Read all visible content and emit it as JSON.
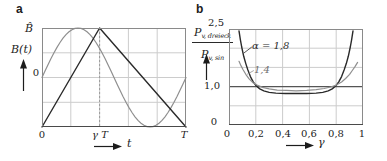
{
  "figure_colors": {
    "grid": "#cccccc",
    "border": "#8a8a8a",
    "axis": "#4a4a4a",
    "dashed": "#9a9a9a",
    "unity_line": "#555555",
    "dark_curve": "#2a2a2a",
    "light_curve": "#8f8f8f"
  },
  "chart_data": [
    {
      "type": "line",
      "panel_letter": "a",
      "xlabel": "t",
      "ylabel": "B(t)",
      "xlim": [
        0,
        1
      ],
      "ylim": [
        -1,
        1
      ],
      "x_ticks": [
        {
          "pos": 0,
          "label": "0"
        },
        {
          "pos": 0.4,
          "label": "γ T"
        },
        {
          "pos": 1,
          "label": "T"
        }
      ],
      "y_labels": {
        "peak": "B̂",
        "axis": "B(t)",
        "zero": "0"
      },
      "x_axis_symbol": "t",
      "grid": {
        "x": [
          0.2,
          0.4,
          0.6,
          0.8
        ],
        "y": [
          -0.5,
          0,
          0.5
        ]
      },
      "dashed_vline": 0.4,
      "gamma": 0.4,
      "series": [
        {
          "name": "sinusoidal-flux",
          "color": "#8f8f8f",
          "width": 1.2,
          "points": [
            [
              0,
              0
            ],
            [
              0.0208,
              0.131
            ],
            [
              0.0417,
              0.259
            ],
            [
              0.0625,
              0.383
            ],
            [
              0.0833,
              0.5
            ],
            [
              0.1042,
              0.609
            ],
            [
              0.125,
              0.707
            ],
            [
              0.1458,
              0.793
            ],
            [
              0.1667,
              0.866
            ],
            [
              0.1875,
              0.924
            ],
            [
              0.2083,
              0.966
            ],
            [
              0.2292,
              0.991
            ],
            [
              0.25,
              1
            ],
            [
              0.2708,
              0.991
            ],
            [
              0.2917,
              0.966
            ],
            [
              0.3125,
              0.924
            ],
            [
              0.3333,
              0.866
            ],
            [
              0.3542,
              0.793
            ],
            [
              0.375,
              0.707
            ],
            [
              0.3958,
              0.609
            ],
            [
              0.4167,
              0.5
            ],
            [
              0.4375,
              0.383
            ],
            [
              0.4583,
              0.259
            ],
            [
              0.4792,
              0.131
            ],
            [
              0.5,
              0
            ],
            [
              0.5208,
              -0.131
            ],
            [
              0.5417,
              -0.259
            ],
            [
              0.5625,
              -0.383
            ],
            [
              0.5833,
              -0.5
            ],
            [
              0.6042,
              -0.609
            ],
            [
              0.625,
              -0.707
            ],
            [
              0.6458,
              -0.793
            ],
            [
              0.6667,
              -0.866
            ],
            [
              0.6875,
              -0.924
            ],
            [
              0.7083,
              -0.966
            ],
            [
              0.7292,
              -0.991
            ],
            [
              0.75,
              -1
            ],
            [
              0.7708,
              -0.991
            ],
            [
              0.7917,
              -0.966
            ],
            [
              0.8125,
              -0.924
            ],
            [
              0.8333,
              -0.866
            ],
            [
              0.8542,
              -0.793
            ],
            [
              0.875,
              -0.707
            ],
            [
              0.8958,
              -0.609
            ],
            [
              0.9167,
              -0.5
            ],
            [
              0.9375,
              -0.383
            ],
            [
              0.9583,
              -0.259
            ],
            [
              0.9792,
              -0.131
            ],
            [
              1,
              0
            ]
          ]
        },
        {
          "name": "triangular-flux",
          "color": "#2a2a2a",
          "width": 1.4,
          "points": [
            [
              0,
              -1
            ],
            [
              0.4,
              1
            ],
            [
              1,
              -1
            ]
          ]
        }
      ]
    },
    {
      "type": "line",
      "panel_letter": "b",
      "xlabel": "γ",
      "ylabel": "P_v,dreieck / P_v,sin",
      "xlim": [
        0,
        1
      ],
      "ylim": [
        0,
        2.5
      ],
      "x_ticks": [
        {
          "pos": 0,
          "label": "0"
        },
        {
          "pos": 0.2,
          "label": "0,2"
        },
        {
          "pos": 0.4,
          "label": "0,4"
        },
        {
          "pos": 0.6,
          "label": "0,6"
        },
        {
          "pos": 0.8,
          "label": "0,8"
        },
        {
          "pos": 1,
          "label": "1"
        }
      ],
      "y_ticks": [
        {
          "pos": 2.5,
          "label": "2,5"
        },
        {
          "pos": 1.0,
          "label": "1,0"
        },
        {
          "pos": 0,
          "label": "0"
        }
      ],
      "y_axis_label": {
        "numerator": "P",
        "numerator_sub": "v, dreieck",
        "denominator": "P",
        "denominator_sub": "v, sin"
      },
      "x_axis_symbol": "γ",
      "ref_hline": 1.0,
      "grid": {
        "x": [
          0.2,
          0.4,
          0.6,
          0.8
        ],
        "y": [
          0.5,
          1.5,
          2
        ]
      },
      "series": [
        {
          "name": "alpha-1-8",
          "label": "α = 1,8",
          "color": "#2a2a2a",
          "width": 1.4,
          "points": [
            [
              0.075,
              2.45
            ],
            [
              0.085,
              2.22
            ],
            [
              0.095,
              2.03
            ],
            [
              0.11,
              1.79
            ],
            [
              0.125,
              1.6
            ],
            [
              0.14,
              1.44
            ],
            [
              0.16,
              1.26
            ],
            [
              0.18,
              1.13
            ],
            [
              0.2,
              1.03
            ],
            [
              0.23,
              0.94
            ],
            [
              0.26,
              0.89
            ],
            [
              0.3,
              0.85
            ],
            [
              0.35,
              0.83
            ],
            [
              0.42,
              0.82
            ],
            [
              0.5,
              0.82
            ],
            [
              0.58,
              0.82
            ],
            [
              0.65,
              0.83
            ],
            [
              0.7,
              0.85
            ],
            [
              0.74,
              0.89
            ],
            [
              0.77,
              0.94
            ],
            [
              0.8,
              1.03
            ],
            [
              0.82,
              1.13
            ],
            [
              0.84,
              1.26
            ],
            [
              0.86,
              1.44
            ],
            [
              0.875,
              1.6
            ],
            [
              0.89,
              1.79
            ],
            [
              0.905,
              2.03
            ],
            [
              0.915,
              2.22
            ],
            [
              0.925,
              2.45
            ]
          ]
        },
        {
          "name": "alpha-1-4",
          "label": "1,4",
          "color": "#8f8f8f",
          "width": 1.2,
          "points": [
            [
              0.075,
              1.66
            ],
            [
              0.09,
              1.54
            ],
            [
              0.105,
              1.44
            ],
            [
              0.125,
              1.32
            ],
            [
              0.15,
              1.2
            ],
            [
              0.18,
              1.1
            ],
            [
              0.21,
              1.04
            ],
            [
              0.25,
              0.98
            ],
            [
              0.3,
              0.94
            ],
            [
              0.36,
              0.91
            ],
            [
              0.43,
              0.9
            ],
            [
              0.5,
              0.89
            ],
            [
              0.58,
              0.9
            ],
            [
              0.65,
              0.92
            ],
            [
              0.71,
              0.95
            ],
            [
              0.76,
              0.99
            ],
            [
              0.8,
              1.04
            ],
            [
              0.84,
              1.12
            ],
            [
              0.87,
              1.21
            ],
            [
              0.9,
              1.32
            ],
            [
              0.92,
              1.42
            ],
            [
              0.94,
              1.52
            ],
            [
              0.96,
              1.63
            ]
          ]
        }
      ],
      "leaders": [
        {
          "from": [
            0.11,
            1.87
          ],
          "to": [
            0.17,
            2.03
          ],
          "color": "#2a2a2a"
        },
        {
          "from": [
            0.135,
            1.32
          ],
          "to": [
            0.185,
            1.42
          ],
          "color": "#8f8f8f"
        }
      ]
    }
  ]
}
